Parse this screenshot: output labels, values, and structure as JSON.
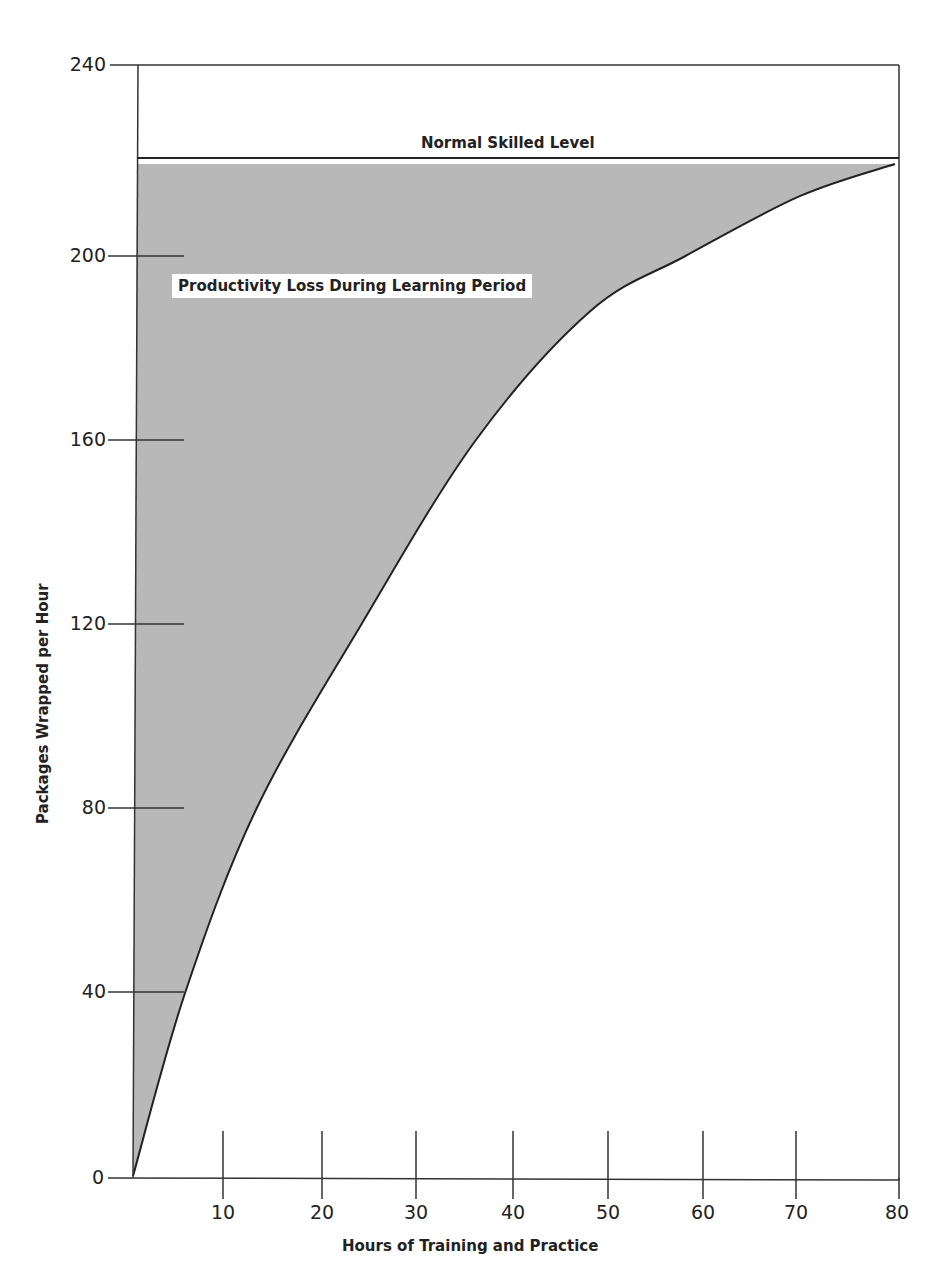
{
  "chart_data": {
    "type": "area",
    "title": "",
    "xlabel": "Hours of Training and Practice",
    "ylabel": "Packages Wrapped per Hour",
    "xlim": [
      0,
      80
    ],
    "ylim": [
      0,
      240
    ],
    "x_ticks": [
      10,
      20,
      30,
      40,
      50,
      60,
      70,
      80
    ],
    "y_ticks": [
      0,
      40,
      80,
      120,
      160,
      200,
      240
    ],
    "grid": false,
    "legend": null,
    "series": [
      {
        "name": "Learning curve",
        "x": [
          0,
          5.5,
          13,
          24,
          36,
          48,
          58,
          70,
          80
        ],
        "values": [
          0,
          40,
          80,
          120,
          160,
          188,
          200,
          213,
          220
        ]
      },
      {
        "name": "Normal Skilled Level",
        "x": [
          0,
          80
        ],
        "values": [
          220,
          220
        ]
      }
    ],
    "shaded_region": {
      "label": "Productivity Loss During Learning Period",
      "between": [
        "Normal Skilled Level",
        "Learning curve"
      ],
      "color": "#b5b5b5"
    },
    "annotations": [
      {
        "text": "Normal Skilled Level",
        "x": 40,
        "y": 220
      },
      {
        "text": "Productivity Loss During Learning Period",
        "x": 20,
        "y": 190
      }
    ]
  },
  "labels": {
    "xlabel": "Hours of Training and Practice",
    "ylabel": "Packages Wrapped per Hour",
    "normal_level": "Normal Skilled Level",
    "area_label": "Productivity Loss During Learning Period",
    "y_ticks": [
      "240",
      "200",
      "160",
      "120",
      "80",
      "40",
      "0"
    ],
    "x_ticks": [
      "10",
      "20",
      "30",
      "40",
      "50",
      "60",
      "70",
      "80"
    ]
  },
  "colors": {
    "shade": "#b8b8b8",
    "line": "#222222"
  }
}
